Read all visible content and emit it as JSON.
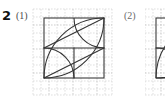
{
  "page": {
    "background_color": "#ffffff",
    "ink_color": "#333333",
    "grid_color": "#c9c9c9",
    "width": 165,
    "height": 101
  },
  "problem": {
    "number": "2",
    "items": [
      {
        "key": "(1)",
        "label": "(1)"
      },
      {
        "key": "(2)",
        "label": "(2)"
      }
    ]
  },
  "figures": [
    {
      "name": "figure-1",
      "label": "(1)",
      "grid": {
        "x": 33,
        "y": 9,
        "width": 79,
        "height": 86,
        "cell_size": 8,
        "cols": 10,
        "rows": 11,
        "style": "dashed"
      },
      "square": {
        "x": 44,
        "y": 18,
        "size": 60
      },
      "description": "square with four quarter-circle arcs forming a lens pattern",
      "arcs": [
        {
          "name": "arc-top-left-large",
          "cx": 44,
          "cy": 18,
          "r": 60,
          "from": "bottom-left",
          "to": "top-right"
        },
        {
          "name": "arc-bottom-right-large",
          "cx": 104,
          "cy": 78,
          "r": 60,
          "from": "top-right",
          "to": "bottom-left"
        },
        {
          "name": "arc-top-right-small",
          "cx": 104,
          "cy": 18,
          "r": 30,
          "from": "left",
          "to": "bottom"
        },
        {
          "name": "arc-bottom-left-small",
          "cx": 44,
          "cy": 78,
          "r": 30,
          "from": "right",
          "to": "top"
        }
      ],
      "chords": [
        {
          "name": "chord-lower-left",
          "x1": 44,
          "y1": 78,
          "x2": 104,
          "y2": 48
        },
        {
          "name": "chord-upper-right",
          "x1": 44,
          "y1": 48,
          "x2": 104,
          "y2": 18
        }
      ]
    },
    {
      "name": "figure-2",
      "label": "(2)",
      "clipped": true,
      "grid": {
        "x": 145,
        "y": 9,
        "width": 20,
        "height": 86,
        "cell_size": 8,
        "cols": 3,
        "rows": 11,
        "style": "dashed"
      },
      "square": {
        "x": 156,
        "y": 18,
        "size": 60
      },
      "description": "partially visible square with arcs, cropped at right page edge"
    }
  ]
}
